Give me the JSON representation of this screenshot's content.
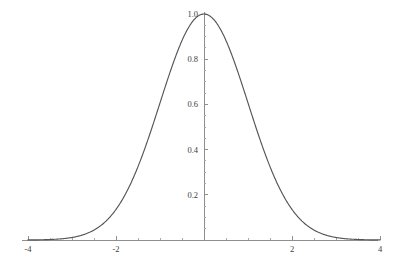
{
  "chart_data": {
    "type": "line",
    "title": "",
    "subtitle": "",
    "xlabel": "",
    "ylabel": "",
    "function": "exp(-x^2/2)",
    "xlim": [
      -4,
      4
    ],
    "ylim": [
      0,
      1.0
    ],
    "grid": false,
    "legend": null,
    "legend_position": "none",
    "axes_style": "crossing-at-origin",
    "line_color": "#555555",
    "axis_color": "#8f8f8f",
    "background_color": "#ffffff",
    "x_ticks_major": [
      -4,
      -2,
      2,
      4
    ],
    "x_tick_labels": [
      "-4",
      "-2",
      "2",
      "4"
    ],
    "x_ticks_minor": [
      -3.5,
      -3,
      -2.5,
      -1.5,
      -1,
      -0.5,
      0.5,
      1,
      1.5,
      2.5,
      3,
      3.5
    ],
    "y_ticks_major": [
      0.2,
      0.4,
      0.6,
      0.8,
      1.0
    ],
    "y_tick_labels": [
      "0.2",
      "0.4",
      "0.6",
      "0.8",
      "1.0"
    ],
    "y_ticks_minor": [
      0.05,
      0.1,
      0.15,
      0.25,
      0.3,
      0.35,
      0.45,
      0.5,
      0.55,
      0.65,
      0.7,
      0.75,
      0.85,
      0.9,
      0.95
    ],
    "series": [
      {
        "name": "gaussian",
        "x": [
          -4.0,
          -3.8,
          -3.6,
          -3.4,
          -3.2,
          -3.0,
          -2.8,
          -2.6,
          -2.4,
          -2.2,
          -2.0,
          -1.8,
          -1.6,
          -1.4,
          -1.2,
          -1.0,
          -0.8,
          -0.6,
          -0.4,
          -0.2,
          0.0,
          0.2,
          0.4,
          0.6,
          0.8,
          1.0,
          1.2,
          1.4,
          1.6,
          1.8,
          2.0,
          2.2,
          2.4,
          2.6,
          2.8,
          3.0,
          3.2,
          3.4,
          3.6,
          3.8,
          4.0
        ],
        "values": [
          0.0003,
          0.0007,
          0.0015,
          0.0031,
          0.0063,
          0.0111,
          0.0198,
          0.034,
          0.0561,
          0.0889,
          0.1353,
          0.1979,
          0.278,
          0.3753,
          0.4868,
          0.6065,
          0.7261,
          0.8353,
          0.9231,
          0.9802,
          1.0,
          0.9802,
          0.9231,
          0.8353,
          0.7261,
          0.6065,
          0.4868,
          0.3753,
          0.278,
          0.1979,
          0.1353,
          0.0889,
          0.0561,
          0.034,
          0.0198,
          0.0111,
          0.0063,
          0.0031,
          0.0015,
          0.0007,
          0.0003
        ]
      }
    ]
  },
  "geometry": {
    "width": 400,
    "height": 265,
    "origin_x": 204,
    "origin_y": 240,
    "px_per_x_unit": 44.0,
    "px_per_y_unit": 226.0,
    "axis_x_start": 22,
    "axis_x_end": 378,
    "axis_y_top": 12,
    "tick_major_len": 4,
    "tick_minor_len": 2
  }
}
